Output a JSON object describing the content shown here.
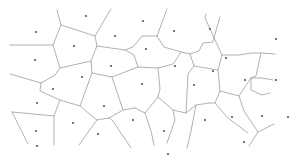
{
  "diagram": {
    "type": "voronoi",
    "width": 293,
    "height": 159,
    "colors": {
      "background": "#ffffff",
      "edge": "#a8a8a8",
      "seed": "#555555"
    },
    "seeds": [
      [
        36,
        32
      ],
      [
        86,
        16
      ],
      [
        74,
        46
      ],
      [
        35,
        60
      ],
      [
        115,
        36
      ],
      [
        143,
        21
      ],
      [
        146,
        49
      ],
      [
        174,
        31
      ],
      [
        210,
        29
      ],
      [
        226,
        58
      ],
      [
        276,
        39
      ],
      [
        111,
        66
      ],
      [
        82,
        77
      ],
      [
        53,
        89
      ],
      [
        175,
        66
      ],
      [
        213,
        71
      ],
      [
        245,
        80
      ],
      [
        276,
        80
      ],
      [
        142,
        84
      ],
      [
        194,
        85
      ],
      [
        37,
        103
      ],
      [
        104,
        106
      ],
      [
        73,
        123
      ],
      [
        133,
        120
      ],
      [
        36,
        131
      ],
      [
        164,
        131
      ],
      [
        205,
        120
      ],
      [
        232,
        117
      ],
      [
        262,
        116
      ],
      [
        98,
        134
      ],
      [
        37,
        146
      ],
      [
        168,
        154
      ],
      [
        288,
        117
      ],
      [
        244,
        142
      ]
    ],
    "edges": [
      [
        [
          57,
          10
        ],
        [
          61,
          25
        ],
        [
          53,
          45
        ],
        [
          10,
          45
        ]
      ],
      [
        [
          61,
          25
        ],
        [
          95,
          36
        ],
        [
          97,
          46
        ],
        [
          91,
          61
        ],
        [
          60,
          68
        ],
        [
          53,
          45
        ]
      ],
      [
        [
          95,
          36
        ],
        [
          111,
          9
        ]
      ],
      [
        [
          97,
          46
        ],
        [
          125,
          50
        ],
        [
          133,
          47
        ],
        [
          142,
          36
        ],
        [
          157,
          36
        ]
      ],
      [
        [
          125,
          50
        ],
        [
          134,
          55
        ],
        [
          138,
          67
        ]
      ],
      [
        [
          157,
          36
        ],
        [
          167,
          9
        ]
      ],
      [
        [
          157,
          36
        ],
        [
          164,
          47
        ],
        [
          181,
          52
        ],
        [
          190,
          54
        ],
        [
          199,
          51
        ],
        [
          203,
          43
        ],
        [
          213,
          42
        ],
        [
          215,
          34
        ],
        [
          220,
          17
        ]
      ],
      [
        [
          206,
          14
        ],
        [
          205,
          18
        ],
        [
          222,
          55
        ],
        [
          238,
          55
        ],
        [
          252,
          53
        ],
        [
          261,
          53
        ],
        [
          275,
          54
        ]
      ],
      [
        [
          261,
          53
        ],
        [
          256,
          76
        ],
        [
          251,
          78
        ]
      ],
      [
        [
          190,
          54
        ],
        [
          194,
          66
        ]
      ],
      [
        [
          181,
          52
        ],
        [
          173,
          64
        ],
        [
          158,
          68
        ],
        [
          138,
          67
        ]
      ],
      [
        [
          91,
          61
        ],
        [
          92,
          73
        ],
        [
          112,
          77
        ],
        [
          138,
          67
        ]
      ],
      [
        [
          60,
          68
        ],
        [
          55,
          75
        ],
        [
          41,
          83
        ],
        [
          10,
          74
        ]
      ],
      [
        [
          41,
          83
        ],
        [
          40,
          91
        ],
        [
          60,
          100
        ],
        [
          80,
          106
        ],
        [
          92,
          73
        ]
      ],
      [
        [
          80,
          106
        ],
        [
          97,
          120
        ],
        [
          109,
          118
        ],
        [
          123,
          110
        ],
        [
          135,
          108
        ]
      ],
      [
        [
          112,
          77
        ],
        [
          123,
          110
        ]
      ],
      [
        [
          158,
          68
        ],
        [
          160,
          89
        ],
        [
          158,
          97
        ],
        [
          145,
          113
        ],
        [
          135,
          108
        ]
      ],
      [
        [
          158,
          97
        ],
        [
          173,
          110
        ],
        [
          186,
          113
        ],
        [
          196,
          105
        ],
        [
          209,
          103
        ]
      ],
      [
        [
          194,
          66
        ],
        [
          188,
          74
        ],
        [
          186,
          113
        ]
      ],
      [
        [
          194,
          66
        ],
        [
          218,
          70
        ],
        [
          222,
          55
        ]
      ],
      [
        [
          218,
          70
        ],
        [
          220,
          91
        ],
        [
          215,
          103
        ],
        [
          209,
          103
        ]
      ],
      [
        [
          220,
          91
        ],
        [
          239,
          96
        ],
        [
          251,
          78
        ]
      ],
      [
        [
          251,
          78
        ],
        [
          262,
          78
        ],
        [
          273,
          80
        ]
      ],
      [
        [
          239,
          96
        ],
        [
          244,
          111
        ],
        [
          258,
          132
        ],
        [
          249,
          146
        ]
      ],
      [
        [
          258,
          132
        ],
        [
          274,
          124
        ]
      ],
      [
        [
          251,
          78
        ],
        [
          251,
          90
        ],
        [
          262,
          95
        ],
        [
          270,
          93
        ]
      ],
      [
        [
          60,
          100
        ],
        [
          54,
          116
        ],
        [
          54,
          145
        ]
      ],
      [
        [
          54,
          116
        ],
        [
          12,
          112
        ]
      ],
      [
        [
          12,
          112
        ],
        [
          28,
          144
        ]
      ],
      [
        [
          97,
          120
        ],
        [
          89,
          131
        ],
        [
          79,
          145
        ]
      ],
      [
        [
          109,
          118
        ],
        [
          113,
          121
        ],
        [
          131,
          148
        ]
      ],
      [
        [
          145,
          113
        ],
        [
          151,
          131
        ],
        [
          154,
          145
        ]
      ],
      [
        [
          173,
          110
        ],
        [
          175,
          120
        ],
        [
          167,
          143
        ]
      ],
      [
        [
          215,
          103
        ],
        [
          228,
          118
        ],
        [
          248,
          133
        ]
      ],
      [
        [
          196,
          105
        ],
        [
          191,
          131
        ],
        [
          187,
          148
        ]
      ]
    ]
  }
}
